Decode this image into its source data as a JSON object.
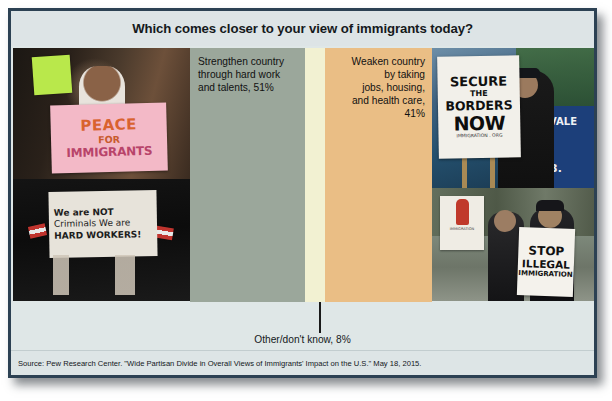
{
  "slide": {
    "title": "Which comes closer to your view of immigrants today?",
    "source": "Source: Pew Research Center. \"Wide Partisan Divide in Overall Views of Immigrants' Impact on the U.S.\" May 18, 2015.",
    "border_color": "#2c4153",
    "background_color": "#dfe7e7"
  },
  "chart_data": {
    "type": "bar",
    "orientation": "horizontal-stacked",
    "title": "Which comes closer to your view of immigrants today?",
    "xlabel": "",
    "ylabel": "",
    "categories": [
      "Strengthen country through hard work and talents",
      "Weaken country by taking jobs, housing, and health care",
      "Other/don't know"
    ],
    "values": [
      51,
      41,
      8
    ],
    "value_labels": [
      "51%",
      "41%",
      "8%"
    ],
    "colors": [
      "#9ba79b",
      "#eabe85",
      "#f2f1d2"
    ],
    "segments": [
      {
        "name": "strengthen",
        "label_lines": [
          "Strengthen country",
          "through hard work",
          "and talents, 51%"
        ],
        "value": 51,
        "color": "#9ba79b",
        "align": "left"
      },
      {
        "name": "other-dont-know",
        "label_lines": [
          "Other/don't know, 8%"
        ],
        "value": 8,
        "color": "#f2f1d2",
        "align": "center",
        "leader_line": true
      },
      {
        "name": "weaken",
        "label_lines": [
          "Weaken country",
          "by taking",
          "jobs, housing,",
          "and health care,",
          "41%"
        ],
        "value": 41,
        "color": "#eabe85",
        "align": "right"
      }
    ],
    "grid": false,
    "legend": "none",
    "annotations": [
      "Other/don't know, 8%"
    ],
    "source": "Source: Pew Research Center. \"Wide Partisan Divide in Overall Views of Immigrants' Impact on the U.S.\" May 18, 2015."
  },
  "labels": {
    "strengthen": "Strengthen country through hard work and talents, 51%",
    "weaken": "Weaken country by taking jobs, housing, and health care, 41%",
    "other": "Other/don't know, 8%"
  },
  "photos": {
    "top_left": {
      "name": "pro-immigrant-child-with-sign",
      "sign_lines": [
        "PEACE",
        "FOR",
        "IMMIGRANTS"
      ],
      "sign_color": "#f3b9c7"
    },
    "bottom_left": {
      "name": "we-are-not-criminals-sign",
      "sign_lines": [
        "We are NOT",
        "Criminals We are",
        "HARD WORKERS!"
      ],
      "sign_color": "#e7e3da"
    },
    "top_right": {
      "name": "secure-the-borders-now-sign",
      "sign_lines": [
        "SECURE",
        "THE",
        "BORDERS",
        "NOW",
        "IMMIGRATION . ORG"
      ],
      "sign_color": "#f2f0ea",
      "background_text": [
        "7",
        "VALE",
        "3."
      ]
    },
    "bottom_right": {
      "name": "stop-illegal-immigration-sign",
      "sign_lines": [
        "STOP",
        "ILLEGAL",
        "IMMIGRATION"
      ],
      "sign_color": "#f4f2ec"
    }
  }
}
